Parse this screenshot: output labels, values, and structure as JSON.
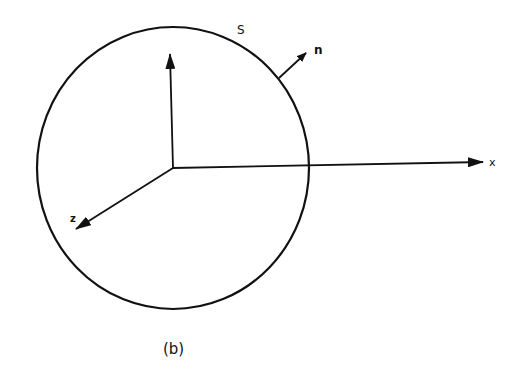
{
  "diagram": {
    "caption": "(b)",
    "surface_label": "S",
    "normal_label": "n",
    "axes": {
      "x_label": "x",
      "y_label": "",
      "z_label": "z"
    },
    "colors": {
      "stroke": "#111111",
      "background": "#ffffff"
    }
  }
}
